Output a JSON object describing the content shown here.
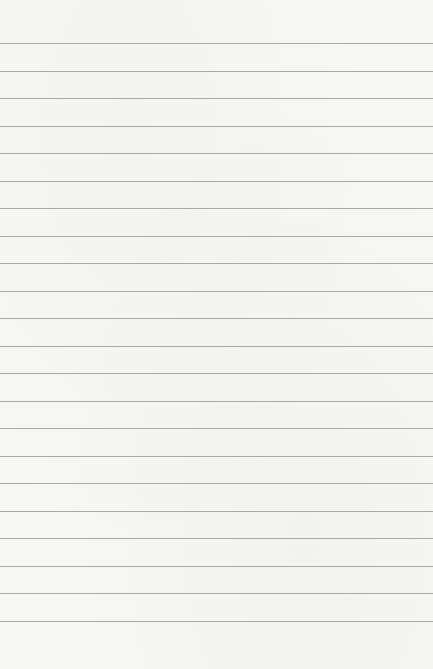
{
  "paper": {
    "type": "lined-paper",
    "background_color": "#f7f7f6",
    "line_color": "#a9a9a9",
    "line_count": 22,
    "first_line_y": 43,
    "line_spacing": 27.5
  }
}
